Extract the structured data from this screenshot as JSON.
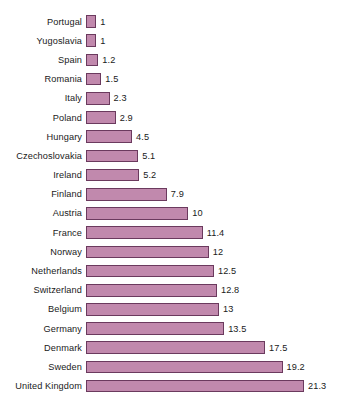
{
  "chart_data": {
    "type": "bar",
    "orientation": "horizontal",
    "title": "",
    "subtitle": "",
    "xlabel": "",
    "ylabel": "",
    "grid": false,
    "legend": null,
    "axis_visible": false,
    "xlim": [
      0,
      21.3
    ],
    "bar_fill_color": "#c189ad",
    "bar_border_color": "#6b3a5e",
    "background_color": "#ffffff",
    "text_color": "#1a1a1a",
    "categories": [
      "Portugal",
      "Yugoslavia",
      "Spain",
      "Romania",
      "Italy",
      "Poland",
      "Hungary",
      "Czechoslovakia",
      "Ireland",
      "Finland",
      "Austria",
      "France",
      "Norway",
      "Netherlands",
      "Switzerland",
      "Belgium",
      "Germany",
      "Denmark",
      "Sweden",
      "United Kingdom"
    ],
    "values": [
      1,
      1,
      1.2,
      1.5,
      2.3,
      2.9,
      4.5,
      5.1,
      5.2,
      7.9,
      10,
      11.4,
      12,
      12.5,
      12.8,
      13,
      13.5,
      17.5,
      19.2,
      21.3
    ],
    "value_labels": [
      "1",
      "1",
      "1.2",
      "1.5",
      "2.3",
      "2.9",
      "4.5",
      "5.1",
      "5.2",
      "7.9",
      "10",
      "11.4",
      "12",
      "12.5",
      "12.8",
      "13",
      "13.5",
      "17.5",
      "19.2",
      "21.3"
    ]
  }
}
